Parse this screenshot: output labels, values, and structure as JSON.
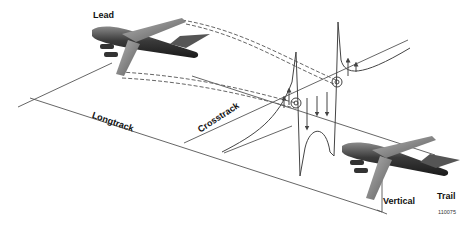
{
  "diagram": {
    "labels": {
      "lead": "Lead",
      "trail": "Trail",
      "longtrack": "Longtrack",
      "crosstrack": "Crosstrack",
      "vertical": "Vertical",
      "figure_id": "110075"
    },
    "elements": [
      {
        "id": "lead-aircraft",
        "description": "Lead transport aircraft (upper left)"
      },
      {
        "id": "trail-aircraft",
        "description": "Trail transport aircraft (lower right)"
      },
      {
        "id": "wingtip-vortex-paths",
        "description": "Dashed lines trailing from lead wingtips"
      },
      {
        "id": "upwash-downwash-profile",
        "description": "Vertical velocity profile with arrows and two vortex cores"
      },
      {
        "id": "longtrack-dimension",
        "description": "Longitudinal separation dimension line"
      },
      {
        "id": "crosstrack-dimension",
        "description": "Lateral separation dimension line"
      },
      {
        "id": "vertical-dimension",
        "description": "Vertical separation arrow at trail aircraft"
      }
    ],
    "colors": {
      "line": "#555555",
      "aircraft_dark": "#2a2a2a",
      "aircraft_light": "#9a9a9a",
      "background": "#ffffff"
    }
  }
}
